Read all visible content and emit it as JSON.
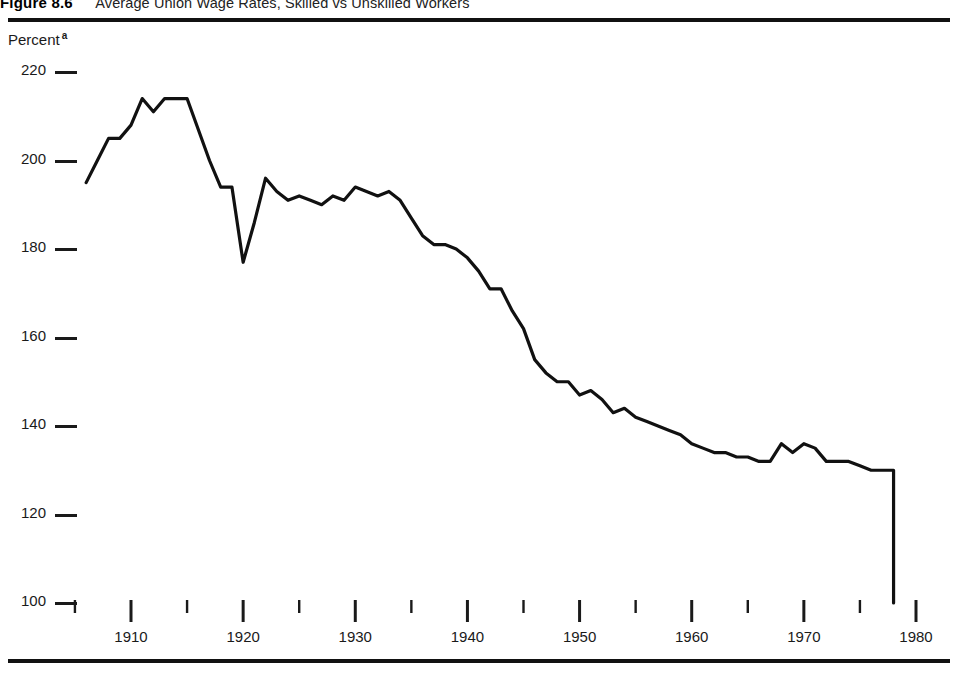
{
  "figure": {
    "number": "Figure 8.6",
    "title": "Average Union Wage Rates, Skilled vs Unskilled Workers"
  },
  "axis": {
    "y_label": "Percent",
    "y_label_superscript": "a"
  },
  "chart_data": {
    "type": "line",
    "title": "Average Union Wage Rates, Skilled vs Unskilled Workers",
    "xlabel": "",
    "ylabel": "Percent",
    "ylim": [
      100,
      220
    ],
    "xlim": [
      1904,
      1982
    ],
    "grid": false,
    "legend": null,
    "yticks": [
      220,
      200,
      180,
      160,
      140,
      120,
      100
    ],
    "xticks": [
      1910,
      1920,
      1930,
      1940,
      1950,
      1960,
      1970,
      1980
    ],
    "xticks_minor": [
      1905,
      1915,
      1925,
      1935,
      1945,
      1955,
      1965,
      1975
    ],
    "line_color": "#111111",
    "series": [
      {
        "name": "Skilled vs unskilled union wage ratio",
        "x": [
          1906,
          1907,
          1908,
          1909,
          1910,
          1911,
          1912,
          1913,
          1914,
          1915,
          1916,
          1917,
          1918,
          1919,
          1920,
          1921,
          1922,
          1923,
          1924,
          1925,
          1926,
          1927,
          1928,
          1929,
          1930,
          1931,
          1932,
          1933,
          1934,
          1935,
          1936,
          1937,
          1938,
          1939,
          1940,
          1941,
          1942,
          1943,
          1944,
          1945,
          1946,
          1947,
          1948,
          1949,
          1950,
          1951,
          1952,
          1953,
          1954,
          1955,
          1956,
          1957,
          1958,
          1959,
          1960,
          1961,
          1962,
          1963,
          1964,
          1965,
          1966,
          1967,
          1968,
          1969,
          1970,
          1971,
          1972,
          1973,
          1974,
          1975,
          1976,
          1977,
          1978,
          1978
        ],
        "y": [
          195,
          200,
          205,
          205,
          208,
          214,
          211,
          214,
          214,
          214,
          207,
          200,
          194,
          194,
          177,
          186,
          196,
          193,
          191,
          192,
          191,
          190,
          192,
          191,
          194,
          193,
          192,
          193,
          191,
          187,
          183,
          181,
          181,
          180,
          178,
          175,
          171,
          171,
          166,
          162,
          155,
          152,
          150,
          150,
          147,
          148,
          146,
          143,
          144,
          142,
          141,
          140,
          139,
          138,
          136,
          135,
          134,
          134,
          133,
          133,
          132,
          132,
          136,
          134,
          136,
          135,
          132,
          132,
          132,
          131,
          130,
          130,
          130,
          100
        ]
      }
    ],
    "annotations": [
      {
        "text": "Series terminates with a vertical drop to the 100 baseline at 1978",
        "x": 1978
      }
    ]
  }
}
